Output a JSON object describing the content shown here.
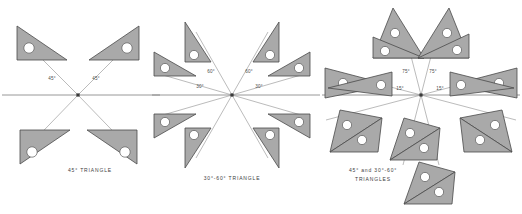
{
  "figure": {
    "width": 522,
    "height": 214,
    "background": "#ffffff",
    "triangle_fill": "#a9a9a9",
    "triangle_stroke": "#4a4a4a",
    "hole_fill": "#ffffff",
    "ray_color": "#8d8d8d",
    "baseline_color": "#7d7d7d",
    "label_color": "#4c4c4c"
  },
  "panels": [
    {
      "id": "panel-45",
      "caption": "45° TRIANGLE",
      "caption_lines": [
        "45° TRIANGLE"
      ],
      "caption_x": 90,
      "caption_y": 172,
      "hub": {
        "x": 78,
        "y": 95
      },
      "baseline": {
        "x1": 2,
        "y1": 95,
        "x2": 160,
        "y2": 95
      },
      "angle_labels": [
        {
          "text": "45°",
          "x": 52,
          "y": 80
        },
        {
          "text": "45°",
          "x": 96,
          "y": 80
        }
      ],
      "rays": [
        {
          "x1": 78,
          "y1": 95,
          "x2": 18,
          "y2": 35
        },
        {
          "x1": 78,
          "y1": 95,
          "x2": 138,
          "y2": 35
        },
        {
          "x1": 78,
          "y1": 95,
          "x2": 20,
          "y2": 155
        },
        {
          "x1": 78,
          "y1": 95,
          "x2": 136,
          "y2": 155
        }
      ],
      "triangles": [
        {
          "name": "triangle-upper-left",
          "points": "17,26 17,60 67,60",
          "hole": {
            "cx": 29,
            "cy": 48,
            "r": 5.2
          }
        },
        {
          "name": "triangle-upper-right",
          "points": "139,26 139,60 89,60",
          "hole": {
            "cx": 127,
            "cy": 48,
            "r": 5.2
          }
        },
        {
          "name": "triangle-lower-left",
          "points": "20,164 20,130 70,130",
          "hole": {
            "cx": 32,
            "cy": 152,
            "r": 5.2
          }
        },
        {
          "name": "triangle-lower-right",
          "points": "137,164 137,130 87,130",
          "hole": {
            "cx": 125,
            "cy": 152,
            "r": 5.2
          }
        }
      ]
    },
    {
      "id": "panel-30-60",
      "caption": "30°-60° TRIANGLE",
      "caption_lines": [
        "30°-60°  TRIANGLE"
      ],
      "caption_x": 232,
      "caption_y": 180,
      "hub": {
        "x": 232,
        "y": 95
      },
      "baseline": {
        "x1": 152,
        "y1": 95,
        "x2": 320,
        "y2": 95
      },
      "angle_labels": [
        {
          "text": "60°",
          "x": 211,
          "y": 73
        },
        {
          "text": "60°",
          "x": 249,
          "y": 73
        },
        {
          "text": "30°",
          "x": 200,
          "y": 88
        },
        {
          "text": "30°",
          "x": 259,
          "y": 88
        }
      ],
      "rays": [
        {
          "x1": 232,
          "y1": 95,
          "x2": 196,
          "y2": 32
        },
        {
          "x1": 232,
          "y1": 95,
          "x2": 268,
          "y2": 32
        },
        {
          "x1": 232,
          "y1": 95,
          "x2": 163,
          "y2": 75
        },
        {
          "x1": 232,
          "y1": 95,
          "x2": 301,
          "y2": 75
        },
        {
          "x1": 232,
          "y1": 95,
          "x2": 163,
          "y2": 115
        },
        {
          "x1": 232,
          "y1": 95,
          "x2": 301,
          "y2": 115
        },
        {
          "x1": 232,
          "y1": 95,
          "x2": 196,
          "y2": 158
        },
        {
          "x1": 232,
          "y1": 95,
          "x2": 268,
          "y2": 158
        }
      ],
      "triangles": [
        {
          "name": "triangle-top-left",
          "points": "185,22 185,62 211,62",
          "hole": {
            "cx": 194,
            "cy": 55,
            "r": 4.6
          }
        },
        {
          "name": "triangle-top-right",
          "points": "279,22 279,62 253,62",
          "hole": {
            "cx": 270,
            "cy": 55,
            "r": 4.6
          }
        },
        {
          "name": "triangle-mid-left",
          "points": "154,52 154,76 196,76",
          "hole": {
            "cx": 165,
            "cy": 68,
            "r": 4.6
          }
        },
        {
          "name": "triangle-mid-right",
          "points": "310,52 310,76 268,76",
          "hole": {
            "cx": 299,
            "cy": 68,
            "r": 4.6
          }
        },
        {
          "name": "triangle-low-left",
          "points": "154,138 154,114 196,114",
          "hole": {
            "cx": 165,
            "cy": 122,
            "r": 4.6
          }
        },
        {
          "name": "triangle-low-right",
          "points": "310,138 310,114 268,114",
          "hole": {
            "cx": 299,
            "cy": 122,
            "r": 4.6
          }
        },
        {
          "name": "triangle-bottom-left",
          "points": "185,168 185,128 211,128",
          "hole": {
            "cx": 194,
            "cy": 135,
            "r": 4.6
          }
        },
        {
          "name": "triangle-bottom-right",
          "points": "279,168 279,128 253,128",
          "hole": {
            "cx": 270,
            "cy": 135,
            "r": 4.6
          }
        }
      ]
    },
    {
      "id": "panel-combined",
      "caption": "45° and 30°-60° TRIANGLES",
      "caption_lines": [
        "45° and 30°-60°",
        "TRIANGLES"
      ],
      "caption_x": 373,
      "caption_y": 172,
      "hub": {
        "x": 421,
        "y": 95
      },
      "baseline": {
        "x1": 322,
        "y1": 95,
        "x2": 520,
        "y2": 95
      },
      "angle_labels": [
        {
          "text": "75°",
          "x": 406,
          "y": 73
        },
        {
          "text": "75°",
          "x": 433,
          "y": 73
        },
        {
          "text": "15°",
          "x": 400,
          "y": 90
        },
        {
          "text": "15°",
          "x": 440,
          "y": 90
        }
      ],
      "rays": [
        {
          "x1": 421,
          "y1": 95,
          "x2": 403,
          "y2": 25
        },
        {
          "x1": 421,
          "y1": 95,
          "x2": 439,
          "y2": 25
        },
        {
          "x1": 421,
          "y1": 95,
          "x2": 326,
          "y2": 70
        },
        {
          "x1": 421,
          "y1": 95,
          "x2": 516,
          "y2": 70
        },
        {
          "x1": 421,
          "y1": 95,
          "x2": 326,
          "y2": 120
        },
        {
          "x1": 421,
          "y1": 95,
          "x2": 516,
          "y2": 120
        },
        {
          "x1": 421,
          "y1": 95,
          "x2": 403,
          "y2": 165
        },
        {
          "x1": 421,
          "y1": 95,
          "x2": 439,
          "y2": 165
        }
      ],
      "triangles": [
        {
          "name": "triangle-top-left-a",
          "points": "393,8 373,58 424,58",
          "hole": {
            "cx": 395,
            "cy": 33,
            "r": 4.6
          }
        },
        {
          "name": "triangle-top-left-b",
          "points": "373,37 373,58 424,58",
          "hole": {
            "cx": 385,
            "cy": 51,
            "r": 4.6
          }
        },
        {
          "name": "triangle-top-right-a",
          "points": "449,8 469,58 418,58",
          "hole": {
            "cx": 447,
            "cy": 33,
            "r": 4.6
          }
        },
        {
          "name": "triangle-top-right-b",
          "points": "469,34 469,58 418,58",
          "hole": {
            "cx": 457,
            "cy": 50,
            "r": 4.6
          }
        },
        {
          "name": "triangle-left-a",
          "points": "325,68 325,98 390,85",
          "hole": {
            "cx": 343,
            "cy": 83,
            "r": 4.6
          }
        },
        {
          "name": "triangle-left-b",
          "points": "392,72 392,96 328,88",
          "hole": {
            "cx": 381,
            "cy": 85,
            "r": 4.6
          }
        },
        {
          "name": "triangle-right-a",
          "points": "517,68 517,98 452,85",
          "hole": {
            "cx": 499,
            "cy": 83,
            "r": 4.6
          }
        },
        {
          "name": "triangle-right-b",
          "points": "450,72 450,96 514,88",
          "hole": {
            "cx": 461,
            "cy": 85,
            "r": 4.6
          }
        },
        {
          "name": "triangle-lower-left-a",
          "points": "340,110 330,152 382,118",
          "hole": {
            "cx": 347,
            "cy": 125,
            "r": 4.6
          }
        },
        {
          "name": "triangle-lower-left-b",
          "points": "330,152 378,152 382,118",
          "hole": {
            "cx": 362,
            "cy": 140,
            "r": 4.6
          }
        },
        {
          "name": "triangle-lower-right-a",
          "points": "502,110 512,152 460,118",
          "hole": {
            "cx": 495,
            "cy": 125,
            "r": 4.6
          }
        },
        {
          "name": "triangle-lower-right-b",
          "points": "512,152 464,152 460,118",
          "hole": {
            "cx": 480,
            "cy": 140,
            "r": 4.6
          }
        },
        {
          "name": "triangle-bottom-a",
          "points": "404,118 390,160 440,128",
          "hole": {
            "cx": 410,
            "cy": 133,
            "r": 4.6
          }
        },
        {
          "name": "triangle-bottom-b",
          "points": "390,160 437,160 440,128",
          "hole": {
            "cx": 424,
            "cy": 148,
            "r": 4.6
          }
        },
        {
          "name": "triangle-bottom-c",
          "points": "419,162 404,204 455,172",
          "hole": {
            "cx": 425,
            "cy": 177,
            "r": 4.6
          }
        },
        {
          "name": "triangle-bottom-d",
          "points": "404,204 452,204 455,172",
          "hole": {
            "cx": 439,
            "cy": 192,
            "r": 4.6
          }
        }
      ]
    }
  ]
}
